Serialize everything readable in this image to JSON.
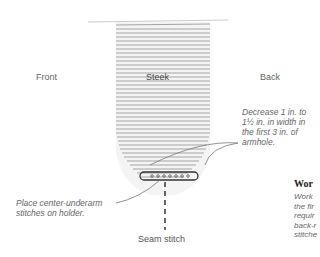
{
  "diagram": {
    "labels": {
      "front": "Front",
      "steek": "Steek",
      "back": "Back",
      "seam_stitch": "Seam stitch"
    },
    "annotations": {
      "decrease": [
        "Decrease 1 in. to",
        "1½ in. in width in",
        "the first 3 in. of",
        "armhole."
      ],
      "holder": [
        "Place center-underarm",
        "stitches on holder."
      ]
    },
    "side_text": {
      "heading": "Wor",
      "lines": [
        "Work",
        "the fir",
        "requir",
        "back-r",
        "stitche"
      ]
    }
  }
}
